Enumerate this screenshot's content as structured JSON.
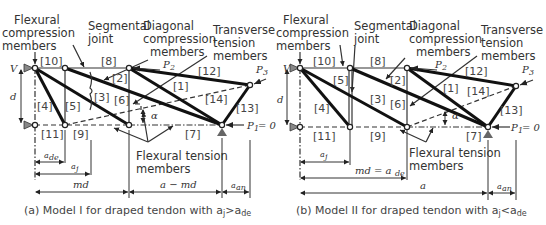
{
  "panel_a": {
    "labels": {
      "flexural_compression": [
        "Flexural",
        "compression",
        "members"
      ],
      "segmental_joint": [
        "Segmental",
        "joint"
      ],
      "diagonal_compression": [
        "Diagonal",
        "compression",
        "members"
      ],
      "transverse_tension": [
        "Transverse",
        "tension",
        "members"
      ],
      "flexural_tension": [
        "Flexural tension",
        "members"
      ]
    },
    "members": [
      "[10]",
      "[8]",
      "[2]",
      "[12]",
      "[1]",
      "[3]",
      "[6]",
      "[14]",
      "[4]",
      "[5]",
      "[13]",
      "[11]",
      "[9]",
      "[7]"
    ],
    "symbols": {
      "V": "V",
      "d": "d",
      "P2": "P",
      "P2_sub": "2",
      "P3": "P",
      "P3_sub": "3",
      "P1": "P",
      "P1_sub": "1",
      "P1_eq": "= 0",
      "alpha": "α"
    },
    "dims": {
      "ade": "a",
      "ade_sub": "de",
      "aj": "a",
      "aj_sub": "j",
      "md": "md",
      "a_md": "a − md",
      "aan": "a",
      "aan_sub": "an"
    },
    "caption": "(a)  Model I for draped tendon with a",
    "caption_sub1": "j",
    "caption_rel": ">a",
    "caption_sub2": "de"
  },
  "panel_b": {
    "labels": {
      "flexural_compression": [
        "Flexural",
        "compression",
        "members"
      ],
      "segmental_joint": [
        "Segmental",
        "joint"
      ],
      "diagonal_compression": [
        "Diagonal",
        "compression",
        "members"
      ],
      "transverse_tension": [
        "Transverse",
        "tension",
        "members"
      ],
      "flexural_tension": [
        "Flexural tension",
        "members"
      ]
    },
    "members": [
      "[10]",
      "[8]",
      "[5]",
      "[2]",
      "[12]",
      "[1]",
      "[14]",
      "[3]",
      "[6]",
      "[4]",
      "[13]",
      "[11]",
      "[9]",
      "[7]"
    ],
    "symbols": {
      "V": "V",
      "d": "d",
      "P2": "P",
      "P2_sub": "2",
      "P3": "P",
      "P3_sub": "3",
      "P1": "P",
      "P1_sub": "1",
      "P1_eq": "= 0",
      "alpha": "α"
    },
    "dims": {
      "aj": "a",
      "aj_sub": "j",
      "md_ade": "md = a",
      "md_ade_sub": "de",
      "a": "a",
      "aan": "a",
      "aan_sub": "an"
    },
    "caption": "(b)  Model II for draped tendon with a",
    "caption_sub1": "j",
    "caption_rel": "<a",
    "caption_sub2": "de"
  }
}
